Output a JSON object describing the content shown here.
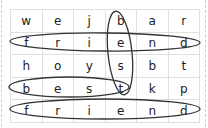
{
  "puzzle": {
    "rows": [
      [
        "w",
        "e",
        "j",
        "b",
        "a",
        "r"
      ],
      [
        "f",
        "r",
        "i",
        "e",
        "n",
        "d"
      ],
      [
        "h",
        "o",
        "y",
        "s",
        "b",
        "t"
      ],
      [
        "b",
        "e",
        "s",
        "t",
        "k",
        "p"
      ],
      [
        "f",
        "r",
        "i",
        "e",
        "n",
        "d"
      ]
    ],
    "found_words": [
      {
        "word": "friend",
        "direction": "horizontal",
        "row": 1
      },
      {
        "word": "best",
        "direction": "vertical",
        "column": 3
      },
      {
        "word": "best",
        "direction": "horizontal",
        "row": 3
      },
      {
        "word": "friend",
        "direction": "horizontal",
        "row": 4
      }
    ],
    "loop_color": "#333333",
    "grid_line_color": "#e0e0e0"
  }
}
